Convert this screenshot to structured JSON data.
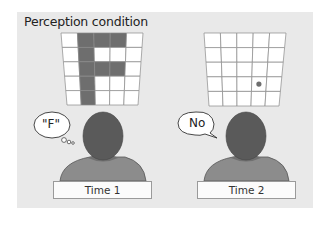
{
  "title": "Perception condition",
  "colors": {
    "panel_bg": "#e9e9e9",
    "grid_fill": "#6e6e6e",
    "grid_empty": "#ffffff",
    "grid_line": "#8a8a8a",
    "head": "#5a5a5a",
    "shoulders": "#8c8c8c",
    "collar": "#707070",
    "dot": "#6e6e6e"
  },
  "panels": [
    {
      "grid": {
        "rows": 5,
        "cols": 5,
        "filled": [
          [
            0,
            1
          ],
          [
            0,
            2
          ],
          [
            0,
            3
          ],
          [
            1,
            1
          ],
          [
            2,
            1
          ],
          [
            2,
            2
          ],
          [
            2,
            3
          ],
          [
            3,
            1
          ],
          [
            4,
            1
          ]
        ],
        "dot": null
      },
      "speech": {
        "type": "thought",
        "text": "\"F\""
      },
      "label": "Time 1"
    },
    {
      "grid": {
        "rows": 5,
        "cols": 5,
        "filled": [],
        "dot": [
          3,
          3
        ]
      },
      "speech": {
        "type": "speech",
        "text": "No"
      },
      "label": "Time 2"
    }
  ]
}
